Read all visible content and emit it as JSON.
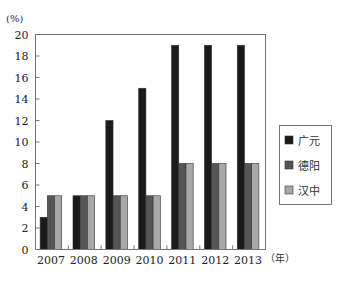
{
  "chart_data": {
    "type": "bar",
    "title": "",
    "ylabel": "(%)",
    "xlabel": "（年）",
    "ylim": [
      0,
      20
    ],
    "yticks": [
      0,
      2,
      4,
      6,
      8,
      10,
      12,
      14,
      16,
      18,
      20
    ],
    "grid": false,
    "legend_position": "right",
    "categories": [
      "2007",
      "2008",
      "2009",
      "2010",
      "2011",
      "2012",
      "2013"
    ],
    "series": [
      {
        "name": "广元",
        "color": "#1a1a1a",
        "values": [
          3,
          5,
          12,
          15,
          19,
          19,
          19
        ]
      },
      {
        "name": "德阳",
        "color": "#555555",
        "values": [
          5,
          5,
          5,
          5,
          8,
          8,
          8
        ]
      },
      {
        "name": "汉中",
        "color": "#a8a8a8",
        "values": [
          5,
          5,
          5,
          5,
          8,
          8,
          8
        ]
      }
    ]
  }
}
